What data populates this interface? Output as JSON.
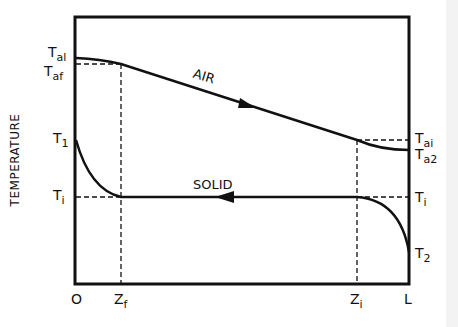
{
  "diagram": {
    "type": "temperature profile (counter-current heat exchange)",
    "y_axis_label": "TEMPERATURE",
    "curves": {
      "air": {
        "label": "AIR",
        "direction": "left-to-right"
      },
      "solid": {
        "label": "SOLID",
        "direction": "right-to-left"
      }
    },
    "x_ticks": [
      {
        "main": "O",
        "sub": ""
      },
      {
        "main": "Z",
        "sub": "f"
      },
      {
        "main": "Z",
        "sub": "i"
      },
      {
        "main": "L",
        "sub": ""
      }
    ],
    "left_labels": [
      {
        "main": "T",
        "sub": "al"
      },
      {
        "main": "T",
        "sub": "af"
      },
      {
        "main": "T",
        "sub": "1"
      },
      {
        "main": "T",
        "sub": "i"
      }
    ],
    "right_labels": [
      {
        "main": "T",
        "sub": "ai"
      },
      {
        "main": "T",
        "sub": "a2"
      },
      {
        "main": "T",
        "sub": "i"
      },
      {
        "main": "T",
        "sub": "2"
      }
    ]
  }
}
